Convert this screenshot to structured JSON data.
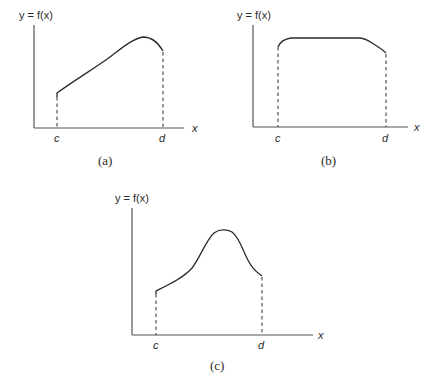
{
  "panels": [
    {
      "id": "a",
      "caption": "(a)",
      "y_label": "y = f(x)",
      "x_label": "x",
      "c_label": "c",
      "d_label": "d",
      "shape": "rising to a peak near d then dropping slightly"
    },
    {
      "id": "b",
      "caption": "(b)",
      "y_label": "y = f(x)",
      "x_label": "x",
      "c_label": "c",
      "d_label": "d",
      "shape": "nearly constant plateau, slight drop near d"
    },
    {
      "id": "c",
      "caption": "(c)",
      "y_label": "y = f(x)",
      "x_label": "x",
      "c_label": "c",
      "d_label": "d",
      "shape": "bell-shaped hump between c and d"
    }
  ]
}
